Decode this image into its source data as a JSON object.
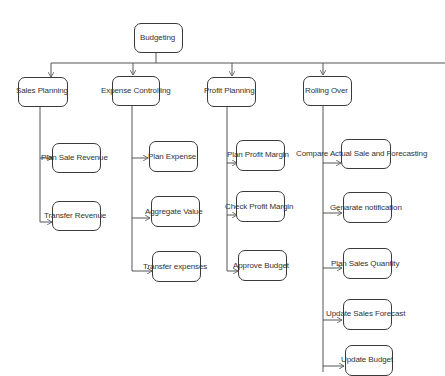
{
  "diagram": {
    "type": "hierarchy",
    "root": {
      "label": "Budgeting"
    },
    "branches": [
      {
        "label": "Sales Planning",
        "children": [
          "Plan Sale Revenue",
          "Transfer Revenue"
        ]
      },
      {
        "label": "Expense Controlling",
        "children": [
          "Plan Expense",
          "Aggregate Value",
          "Transfer expenses"
        ]
      },
      {
        "label": "Profit Planning",
        "children": [
          "Plan Profit Margin",
          "Check Profit Margin",
          "Approve Budget"
        ]
      },
      {
        "label": "Rolling Over",
        "children": [
          "Compare Actual Sale and Forecasting",
          "Genarate notification",
          "Plan Sales Quantity",
          "Update Sales Forecast",
          "Update Budget"
        ]
      }
    ],
    "colors": {
      "line": "#555555",
      "border": "#3a3a3a",
      "text": "#333333",
      "background": "#ffffff"
    }
  }
}
